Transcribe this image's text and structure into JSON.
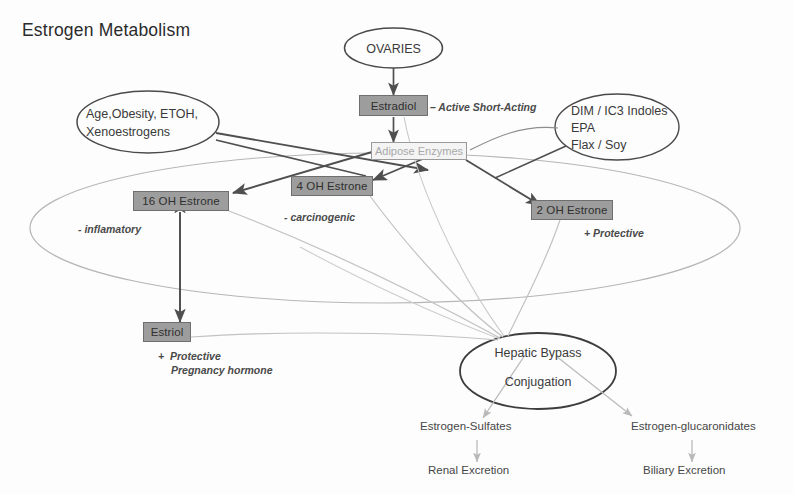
{
  "title": "Estrogen Metabolism",
  "colors": {
    "box_fill": "#9d9d9d",
    "box_border": "#6f6f6f",
    "box_text": "#2f2f2f",
    "enzyme_box_fill": "#f4f4f4",
    "enzyme_box_text": "#a9a9a9",
    "ellipse_stroke": "#4a4a4a",
    "dark_arrow": "#4f4f4f",
    "light_arrow": "#bcbcbc",
    "background_ellipse": "#b6b6b6",
    "title_color": "#2b2b2b"
  },
  "nodes": {
    "ovaries": {
      "label": "OVARIES",
      "shape": "ellipse"
    },
    "estradiol": {
      "label": "Estradiol",
      "shape": "box"
    },
    "estradiol_note": {
      "label": "– Active Short-Acting"
    },
    "adipose_enzymes": {
      "label": "Adipose Enzymes",
      "shape": "outlined-box"
    },
    "modifiers": {
      "line1": "Age,Obesity, ETOH,",
      "line2": "Xenoestrogens",
      "shape": "ellipse"
    },
    "supplements": {
      "line1": "DIM / IC3 Indoles",
      "line2": "EPA",
      "line3": "Flax / Soy",
      "shape": "ellipse"
    },
    "estrone_16oh": {
      "label": "16 OH Estrone",
      "shape": "box"
    },
    "estrone_16oh_note": {
      "label": "- inflamatory"
    },
    "estrone_4oh": {
      "label": "4 OH Estrone",
      "shape": "box"
    },
    "estrone_4oh_note": {
      "label": "- carcinogenic"
    },
    "estrone_2oh": {
      "label": "2 OH Estrone",
      "shape": "box"
    },
    "estrone_2oh_note": {
      "label": "+ Protective"
    },
    "estriol": {
      "label": "Estriol",
      "shape": "box"
    },
    "estriol_note": {
      "line1": "+  Protective",
      "line2": "Pregnancy hormone"
    },
    "hepatic_bypass": {
      "label": "Hepatic Bypass",
      "shape": "ellipse"
    },
    "conjugation": {
      "label": "Conjugation"
    },
    "estrogen_sulfates": {
      "label": "Estrogen-Sulfates"
    },
    "renal_excretion": {
      "label": "Renal Excretion"
    },
    "estrogen_glucaronidates": {
      "label": "Estrogen-glucaronidates"
    },
    "biliary_excretion": {
      "label": "Biliary Excretion"
    }
  },
  "edges": [
    {
      "name": "ovaries-to-estradiol",
      "from": "ovaries",
      "to": "estradiol",
      "style": "dark-arrow"
    },
    {
      "name": "estradiol-to-adipose",
      "from": "estradiol",
      "to": "adipose_enzymes",
      "style": "dark-arrow"
    },
    {
      "name": "modifiers-to-adipose",
      "from": "modifiers",
      "to": "adipose_enzymes",
      "style": "dark-arrow"
    },
    {
      "name": "modifiers-to-4oh",
      "from": "modifiers",
      "to": "estrone_4oh",
      "style": "dark-arrow"
    },
    {
      "name": "adipose-to-16oh",
      "from": "adipose_enzymes",
      "to": "estrone_16oh",
      "style": "dark-arrow"
    },
    {
      "name": "adipose-to-4oh",
      "from": "adipose_enzymes",
      "to": "estrone_4oh",
      "style": "dark-arrow"
    },
    {
      "name": "adipose-to-2oh",
      "from": "adipose_enzymes",
      "to": "estrone_2oh",
      "style": "dark-arrow"
    },
    {
      "name": "supplements-to-2oh",
      "from": "supplements",
      "to": "estrone_2oh",
      "style": "dark-line"
    },
    {
      "name": "16oh-estriol-reversible",
      "from": "estrone_16oh",
      "to": "estriol",
      "style": "dark-double-arrow"
    },
    {
      "name": "16oh-to-hepatic",
      "from": "estrone_16oh",
      "to": "hepatic_bypass",
      "style": "light-curve"
    },
    {
      "name": "4oh-to-hepatic",
      "from": "estrone_4oh",
      "to": "hepatic_bypass",
      "style": "light-curve"
    },
    {
      "name": "2oh-to-hepatic",
      "from": "estrone_2oh",
      "to": "hepatic_bypass",
      "style": "light-curve"
    },
    {
      "name": "estriol-to-hepatic",
      "from": "estriol",
      "to": "hepatic_bypass",
      "style": "light-curve"
    },
    {
      "name": "estradiol-to-hepatic",
      "from": "estradiol",
      "to": "hepatic_bypass",
      "style": "light-curve"
    },
    {
      "name": "hepatic-to-sulfates",
      "from": "hepatic_bypass",
      "to": "estrogen_sulfates",
      "style": "light-arrow"
    },
    {
      "name": "hepatic-to-glucaronidates",
      "from": "hepatic_bypass",
      "to": "estrogen_glucaronidates",
      "style": "light-arrow"
    },
    {
      "name": "sulfates-to-renal",
      "from": "estrogen_sulfates",
      "to": "renal_excretion",
      "style": "light-arrow"
    },
    {
      "name": "glucaronidates-to-biliary",
      "from": "estrogen_glucaronidates",
      "to": "biliary_excretion",
      "style": "light-arrow"
    }
  ]
}
